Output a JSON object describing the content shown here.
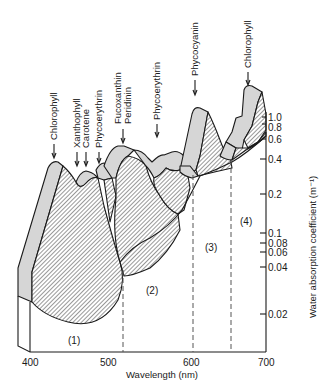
{
  "figure": {
    "x_axis": {
      "label": "Wavelength (nm)",
      "ticks": [
        "400",
        "500",
        "600",
        "700"
      ]
    },
    "y_axis": {
      "label": "Water absorption coefficient (m⁻¹)",
      "ticks": [
        "1.0",
        "0.8",
        "0.6",
        "0.4",
        "0.2",
        "0.1",
        "0.08",
        "0.06",
        "0.04",
        "0.02"
      ]
    },
    "regions": [
      "(1)",
      "(2)",
      "(3)",
      "(4)"
    ],
    "pigment_labels": [
      "Chlorophyll",
      "Xanthophyll",
      "Carotene",
      "Phycoerythrin",
      "Fucoxanthin",
      "Peridinin",
      "Phycoerythrin",
      "Phycocyanin",
      "Chlorophyll"
    ],
    "colors": {
      "ink": "#1a1a1a",
      "face_fill": "#d6d6d6",
      "hatch": "#333333",
      "background": "#ffffff"
    }
  }
}
